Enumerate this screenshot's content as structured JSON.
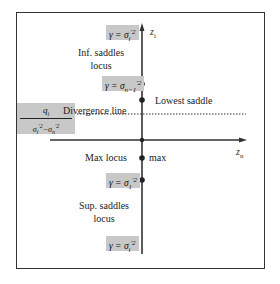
{
  "diagram": {
    "axes": {
      "vertical_label": "z",
      "vertical_label_sub": "i",
      "horizontal_label": "z",
      "horizontal_label_sub": "n"
    },
    "boxes": {
      "top_gamma": {
        "lhs": "γ = σ",
        "sub": "i",
        "sup": "'2"
      },
      "gamma_n_minus_1": {
        "lhs": "γ = σ",
        "sub": "n−1",
        "sup": "'2"
      },
      "gamma_1": {
        "lhs": "γ = σ",
        "sub": "1",
        "sup": "'2"
      },
      "bottom_gamma": {
        "lhs": "γ = σ",
        "sub": "i",
        "sup": "'2"
      },
      "fraction": {
        "numerator": "q",
        "numerator_sub": "i",
        "denominator_a": "σ",
        "denominator_a_sub": "i",
        "denominator_a_sup": "'2",
        "denominator_op": "−σ",
        "denominator_b_sub": "n",
        "denominator_b_sup": "'2"
      }
    },
    "labels": {
      "inf_saddles_line1": "Inf. saddles",
      "inf_saddles_line2": "locus",
      "lowest_saddle": "Lowest saddle",
      "divergence_line": "Divergence line",
      "max_locus": "Max locus",
      "max": "max",
      "sup_saddles_line1": "Sup. saddles",
      "sup_saddles_line2": "locus"
    },
    "points": [
      {
        "name": "gamma-n-minus-1-point",
        "y": 84
      },
      {
        "name": "lowest-saddle-point",
        "y": 100
      },
      {
        "name": "origin-point",
        "y": 140
      },
      {
        "name": "max-point",
        "y": 158
      },
      {
        "name": "gamma-1-point",
        "y": 180
      }
    ],
    "colors": {
      "box_fill": "#c8c8c8",
      "line": "#333333"
    }
  }
}
